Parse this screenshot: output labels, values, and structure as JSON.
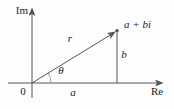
{
  "diagram": {
    "type": "complex-plane-argand-diagram",
    "axis_labels": {
      "imaginary": "Im",
      "real": "Re"
    },
    "origin_label": "0",
    "point_label": "a + bi",
    "radius_label": "r",
    "angle_label": "θ",
    "horizontal_component_label": "a",
    "vertical_component_label": "b",
    "colors": {
      "line": "#555555",
      "text": "#1c1c1c",
      "background": "#fdfdfd"
    }
  }
}
